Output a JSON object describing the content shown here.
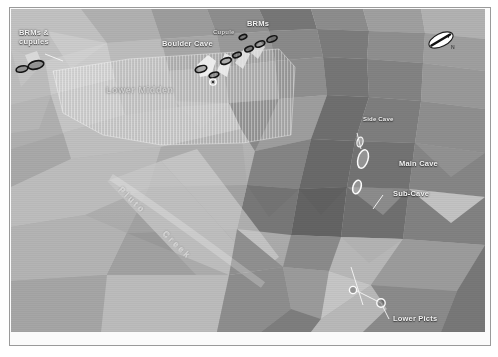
{
  "map": {
    "type": "terrain-tin-surface",
    "style": "grayscale shaded triangulated irregular network",
    "north_arrow": "north-arrow-icon",
    "creek_label": "Pluto Creek",
    "midden_label": "Lower Midden"
  },
  "labels": {
    "brms_cupules": "BRMs &\ncupules",
    "boulder_cave": "Boulder Cave",
    "cupule": "Cupule",
    "brms": "BRMs",
    "lower_midden": "Lower Midden",
    "side_cave": "Side Cave",
    "main_cave": "Main Cave",
    "sub_cave": "Sub-Cave",
    "lower_picts": "Lower Picts",
    "pluto_creek_1": "Pluto",
    "pluto_creek_2": "Creek"
  },
  "features": [
    {
      "name": "BRMs & cupules",
      "symbol": "ellipse-dark",
      "x": 24,
      "y": 57
    },
    {
      "name": "Boulder Cave",
      "symbol": "ellipse-dark",
      "x": 203,
      "y": 63
    },
    {
      "name": "Cupule",
      "symbol": "ellipse-dark",
      "x": 224,
      "y": 46
    },
    {
      "name": "BRMs",
      "symbol": "ellipse-dark",
      "x": 252,
      "y": 37
    },
    {
      "name": "Side Cave",
      "symbol": "cave-opening",
      "x": 349,
      "y": 133
    },
    {
      "name": "Main Cave",
      "symbol": "cave-opening",
      "x": 381,
      "y": 162
    },
    {
      "name": "Sub-Cave",
      "symbol": "cave-opening",
      "x": 372,
      "y": 186
    },
    {
      "name": "Lower Picts",
      "symbol": "point-circle",
      "x": 380,
      "y": 309
    }
  ],
  "colors": {
    "label_text": "#f2f2f2",
    "frame": "#9a9a9a",
    "background": "#ffffff",
    "terrain_light": "#c9c9c9",
    "terrain_mid": "#9b9b9b",
    "terrain_dark": "#6e6e6e"
  }
}
